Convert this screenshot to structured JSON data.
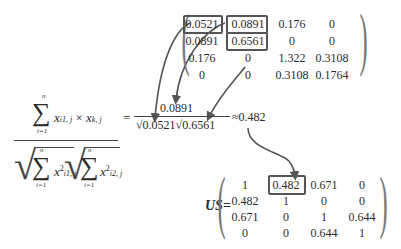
{
  "top_matrix": {
    "rows": [
      [
        "0.0521",
        "0.0891",
        "0.176",
        "0"
      ],
      [
        "0.0891",
        "0.6561",
        "0",
        "0"
      ],
      [
        "0.176",
        "0",
        "1.322",
        "0.3108"
      ],
      [
        "0",
        "0",
        "0.3108",
        "0.1764"
      ]
    ],
    "highlighted_cells": [
      "0.0521",
      "0.0891",
      "0.6561"
    ]
  },
  "formula": {
    "numerator": {
      "sum_upper": "n",
      "sum_lower": "i=1",
      "term": "x",
      "sub1": "i1, j",
      "times": "×",
      "term2": "x",
      "sub2": "k, j"
    },
    "denominator": {
      "left": {
        "sum_upper": "n",
        "sum_lower": "i=1",
        "term": "x",
        "sup": "2",
        "sub": "i1, j"
      },
      "right": {
        "sum_upper": "n",
        "sum_lower": "i=1",
        "term": "x",
        "sup": "2",
        "sub": "i2, j"
      }
    }
  },
  "computation": {
    "equals": "=",
    "numerator": "0.0891",
    "denominator_a": "√0.0521",
    "denominator_b": "√0.6561",
    "approx": "≈",
    "result": "0.482"
  },
  "us_matrix": {
    "label": "US",
    "equals": "=",
    "rows": [
      [
        "1",
        "0.482",
        "0.671",
        "0"
      ],
      [
        "0.482",
        "1",
        "0",
        "0"
      ],
      [
        "0.671",
        "0",
        "1",
        "0.644"
      ],
      [
        "0",
        "0",
        "0.644",
        "1"
      ]
    ],
    "highlighted_cell": "0.482"
  },
  "colors": {
    "arrow": "#555555",
    "box": "#555555",
    "text": "#2a2a2a",
    "paren": "#777777"
  }
}
